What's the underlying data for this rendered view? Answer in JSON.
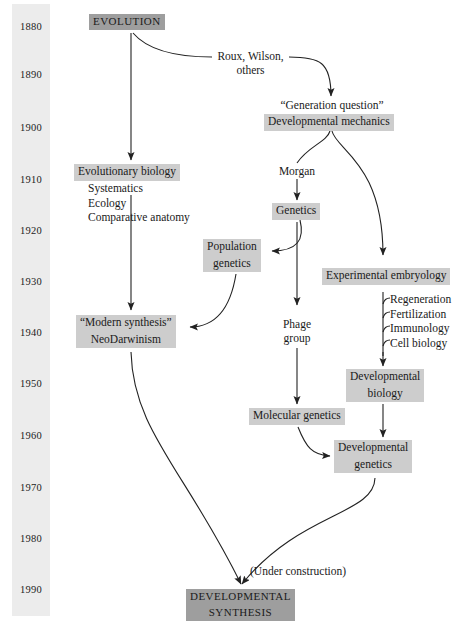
{
  "diagram": {
    "note_label": "(Under construction)",
    "colors": {
      "axis_band": "#ececec",
      "node_shade": "#cdcdcd",
      "node_shade_dark": "#9e9e9e",
      "stroke": "#222222",
      "text": "#1a1a1a"
    }
  },
  "timeline": {
    "name": "decade-axis",
    "years": [
      {
        "label": "1880",
        "y": 22
      },
      {
        "label": "1890",
        "y": 70
      },
      {
        "label": "1900",
        "y": 123
      },
      {
        "label": "1910",
        "y": 175
      },
      {
        "label": "1920",
        "y": 226
      },
      {
        "label": "1930",
        "y": 277
      },
      {
        "label": "1940",
        "y": 328
      },
      {
        "label": "1950",
        "y": 379
      },
      {
        "label": "1960",
        "y": 431
      },
      {
        "label": "1970",
        "y": 483
      },
      {
        "label": "1980",
        "y": 534
      },
      {
        "label": "1990",
        "y": 585
      }
    ]
  },
  "nodes": {
    "evolution": {
      "label": "EVOLUTION"
    },
    "generation_question": {
      "label": "“Generation question”"
    },
    "developmental_mechanics": {
      "label": "Developmental mechanics"
    },
    "evolutionary_biology": {
      "label": "Evolutionary biology"
    },
    "evolutionary_biology_sub": {
      "items": [
        "Systematics",
        "Ecology",
        "Comparative anatomy"
      ]
    },
    "genetics": {
      "label": "Genetics"
    },
    "population_genetics": {
      "line1": "Population",
      "line2": "genetics"
    },
    "experimental_embryology": {
      "label": "Experimental embryology"
    },
    "experimental_embryology_sub": {
      "items": [
        "Regeneration",
        "Fertilization",
        "Immunology",
        "Cell biology"
      ]
    },
    "modern_synthesis": {
      "line1": "“Modern synthesis”",
      "line2": "NeoDarwinism"
    },
    "phage_group": {
      "line1": "Phage",
      "line2": "group"
    },
    "developmental_biology": {
      "line1": "Developmental",
      "line2": "biology"
    },
    "molecular_genetics": {
      "label": "Molecular genetics"
    },
    "developmental_genetics": {
      "line1": "Developmental",
      "line2": "genetics"
    },
    "developmental_synthesis": {
      "line1": "DEVELOPMENTAL",
      "line2": "SYNTHESIS"
    }
  },
  "edge_labels": {
    "roux_wilson": {
      "line1": "Roux, Wilson,",
      "line2": "others"
    },
    "morgan": {
      "label": "Morgan"
    }
  }
}
